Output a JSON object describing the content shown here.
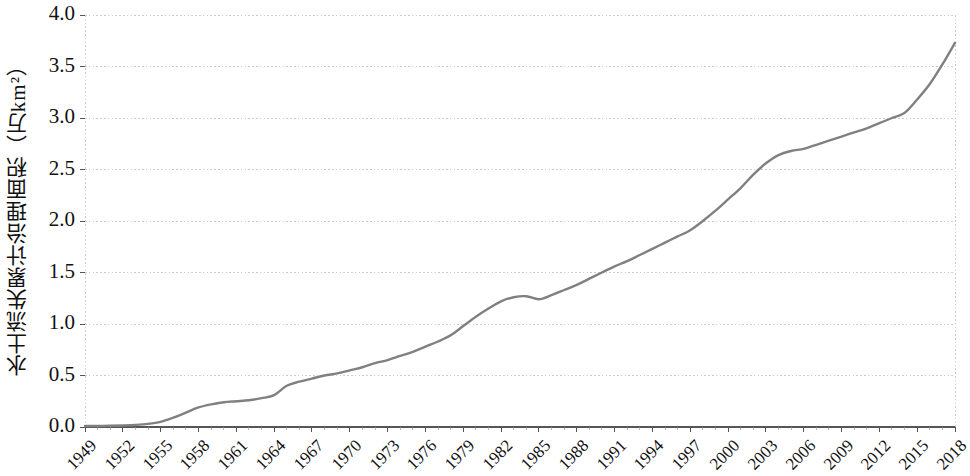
{
  "chart_data": {
    "type": "line",
    "title": "",
    "xlabel": "",
    "ylabel": "水土流失累计治理面积（万km²）",
    "ylabel_plain": "水土流失累计治理面积 (万km2)",
    "xlim": [
      1949,
      2018
    ],
    "ylim": [
      0.0,
      4.0
    ],
    "grid": true,
    "legend": "none",
    "line_color": "#808080",
    "axis_color": "#555555",
    "grid_color": "#cccccc",
    "y_ticks": [
      "0.0",
      "0.5",
      "1.0",
      "1.5",
      "2.0",
      "2.5",
      "3.0",
      "3.5",
      "4.0"
    ],
    "y_tick_values": [
      0.0,
      0.5,
      1.0,
      1.5,
      2.0,
      2.5,
      3.0,
      3.5,
      4.0
    ],
    "x_ticks": [
      "1949",
      "1952",
      "1955",
      "1958",
      "1961",
      "1964",
      "1967",
      "1970",
      "1973",
      "1976",
      "1979",
      "1982",
      "1985",
      "1988",
      "1991",
      "1994",
      "1997",
      "2000",
      "2003",
      "2006",
      "2009",
      "2012",
      "2015",
      "2018"
    ],
    "x_tick_values": [
      1949,
      1952,
      1955,
      1958,
      1961,
      1964,
      1967,
      1970,
      1973,
      1976,
      1979,
      1982,
      1985,
      1988,
      1991,
      1994,
      1997,
      2000,
      2003,
      2006,
      2009,
      2012,
      2015,
      2018
    ],
    "series": [
      {
        "name": "水土流失累计治理面积",
        "x": [
          1949,
          1950,
          1951,
          1952,
          1953,
          1954,
          1955,
          1956,
          1957,
          1958,
          1959,
          1960,
          1961,
          1962,
          1963,
          1964,
          1965,
          1966,
          1967,
          1968,
          1969,
          1970,
          1971,
          1972,
          1973,
          1974,
          1975,
          1976,
          1977,
          1978,
          1979,
          1980,
          1981,
          1982,
          1983,
          1984,
          1985,
          1986,
          1987,
          1988,
          1989,
          1990,
          1991,
          1992,
          1993,
          1994,
          1995,
          1996,
          1997,
          1998,
          1999,
          2000,
          2001,
          2002,
          2003,
          2004,
          2005,
          2006,
          2007,
          2008,
          2009,
          2010,
          2011,
          2012,
          2013,
          2014,
          2015,
          2016,
          2017,
          2018
        ],
        "y": [
          0.01,
          0.01,
          0.012,
          0.015,
          0.02,
          0.03,
          0.05,
          0.09,
          0.14,
          0.19,
          0.22,
          0.24,
          0.25,
          0.26,
          0.28,
          0.31,
          0.4,
          0.44,
          0.47,
          0.5,
          0.52,
          0.55,
          0.58,
          0.62,
          0.65,
          0.69,
          0.73,
          0.78,
          0.83,
          0.89,
          0.98,
          1.07,
          1.15,
          1.22,
          1.26,
          1.27,
          1.24,
          1.28,
          1.33,
          1.38,
          1.44,
          1.5,
          1.56,
          1.61,
          1.67,
          1.73,
          1.79,
          1.85,
          1.91,
          2.0,
          2.1,
          2.21,
          2.32,
          2.45,
          2.56,
          2.64,
          2.68,
          2.7,
          2.74,
          2.78,
          2.82,
          2.86,
          2.9,
          2.95,
          3.0,
          3.05,
          3.18,
          3.33,
          3.52,
          3.73
        ]
      }
    ]
  },
  "axes": {
    "y_title": "水土流失累计治理面积（万km²）"
  }
}
